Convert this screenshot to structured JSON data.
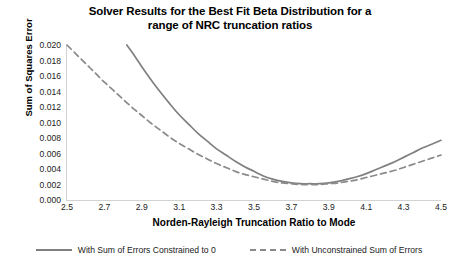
{
  "chart_data": {
    "type": "line",
    "title": "Solver Results for the Best Fit Beta Distribution for a range of NRC truncation ratios",
    "title_line1": "Solver Results for the Best Fit Beta Distribution for a",
    "title_line2": "range of NRC truncation ratios",
    "xlabel": "Norden-Rayleigh Truncation Ratio to Mode",
    "ylabel": "Sum of Squares Error",
    "xlim": [
      2.5,
      4.5
    ],
    "ylim": [
      0.0,
      0.02
    ],
    "grid": false,
    "legend_position": "bottom",
    "x_ticks": [
      2.5,
      2.7,
      2.9,
      3.1,
      3.3,
      3.5,
      3.7,
      3.9,
      4.1,
      4.3,
      4.5
    ],
    "x_tick_labels": [
      "2.5",
      "2.7",
      "2.9",
      "3.1",
      "3.3",
      "3.5",
      "3.7",
      "3.9",
      "4.1",
      "4.3",
      "4.5"
    ],
    "y_ticks": [
      0.0,
      0.002,
      0.004,
      0.006,
      0.008,
      0.01,
      0.012,
      0.014,
      0.016,
      0.018,
      0.02
    ],
    "y_tick_labels": [
      "0.000",
      "0.002",
      "0.004",
      "0.006",
      "0.008",
      "0.010",
      "0.012",
      "0.014",
      "0.016",
      "0.018",
      "0.020"
    ],
    "series": [
      {
        "name": "With Sum of Errors Constrained to 0",
        "style": "solid",
        "color": "#808080",
        "x": [
          2.82,
          2.85,
          2.9,
          2.95,
          3.0,
          3.05,
          3.1,
          3.15,
          3.2,
          3.25,
          3.3,
          3.35,
          3.4,
          3.45,
          3.5,
          3.55,
          3.6,
          3.65,
          3.7,
          3.75,
          3.8,
          3.85,
          3.9,
          3.95,
          4.0,
          4.05,
          4.1,
          4.15,
          4.2,
          4.25,
          4.3,
          4.35,
          4.4,
          4.45,
          4.5
        ],
        "y": [
          0.02,
          0.019,
          0.0172,
          0.0155,
          0.0139,
          0.0124,
          0.011,
          0.0098,
          0.0086,
          0.0076,
          0.0066,
          0.0058,
          0.005,
          0.0043,
          0.0037,
          0.0031,
          0.0027,
          0.0024,
          0.0022,
          0.0021,
          0.0021,
          0.0021,
          0.0022,
          0.0024,
          0.0027,
          0.003,
          0.0034,
          0.0039,
          0.0044,
          0.0049,
          0.0055,
          0.0061,
          0.0067,
          0.0072,
          0.0077
        ]
      },
      {
        "name": "With Unconstrained Sum of Errors",
        "style": "dashed",
        "color": "#8a8a8a",
        "x": [
          2.5,
          2.55,
          2.6,
          2.65,
          2.7,
          2.75,
          2.8,
          2.85,
          2.9,
          2.95,
          3.0,
          3.05,
          3.1,
          3.15,
          3.2,
          3.25,
          3.3,
          3.35,
          3.4,
          3.45,
          3.5,
          3.55,
          3.6,
          3.65,
          3.7,
          3.75,
          3.8,
          3.85,
          3.9,
          3.95,
          4.0,
          4.05,
          4.1,
          4.15,
          4.2,
          4.25,
          4.3,
          4.35,
          4.4,
          4.45,
          4.5
        ],
        "y": [
          0.02,
          0.0188,
          0.0176,
          0.0164,
          0.0152,
          0.0141,
          0.013,
          0.0119,
          0.0109,
          0.0099,
          0.009,
          0.0081,
          0.0073,
          0.0066,
          0.0059,
          0.0053,
          0.0047,
          0.0042,
          0.0037,
          0.0033,
          0.003,
          0.0027,
          0.0024,
          0.0022,
          0.0021,
          0.002,
          0.002,
          0.002,
          0.0021,
          0.0022,
          0.0024,
          0.0026,
          0.0029,
          0.0032,
          0.0035,
          0.0038,
          0.0042,
          0.0046,
          0.005,
          0.0054,
          0.0058
        ]
      }
    ]
  },
  "colors": {
    "axis": "#d2d2d2",
    "series_solid": "#808080",
    "series_dashed": "#8a8a8a",
    "text": "#1a1a1a",
    "background": "#ffffff"
  }
}
